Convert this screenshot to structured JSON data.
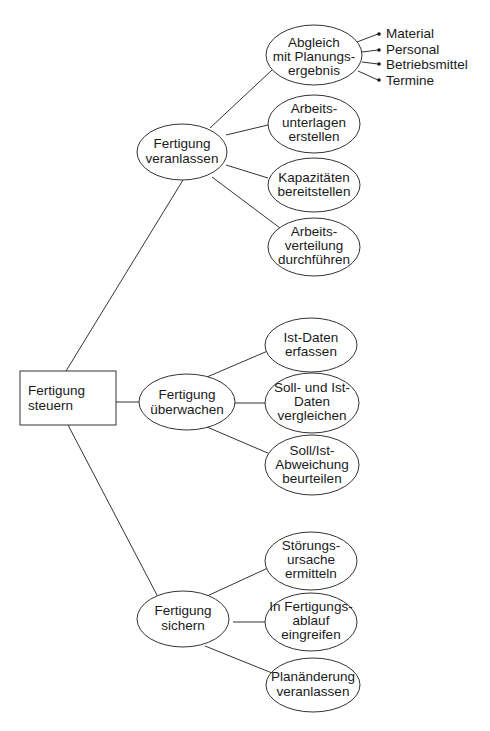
{
  "diagram": {
    "type": "tree",
    "root": {
      "id": "root",
      "lines": [
        "Fertigung",
        "steuern"
      ],
      "shape": "rect"
    },
    "branches": [
      {
        "id": "b1",
        "lines": [
          "Fertigung",
          "veranlassen"
        ],
        "children": [
          {
            "id": "b1c1",
            "lines": [
              "Abgleich",
              "mit Planungs-",
              "ergebnis"
            ],
            "leaves": [
              "Material",
              "Personal",
              "Betriebsmittel",
              "Termine"
            ]
          },
          {
            "id": "b1c2",
            "lines": [
              "Arbeits-",
              "unterlagen",
              "erstellen"
            ]
          },
          {
            "id": "b1c3",
            "lines": [
              "Kapazitäten",
              "bereitstellen"
            ]
          },
          {
            "id": "b1c4",
            "lines": [
              "Arbeits-",
              "verteilung",
              "durchführen"
            ]
          }
        ]
      },
      {
        "id": "b2",
        "lines": [
          "Fertigung",
          "überwachen"
        ],
        "children": [
          {
            "id": "b2c1",
            "lines": [
              "Ist-Daten",
              "erfassen"
            ]
          },
          {
            "id": "b2c2",
            "lines": [
              "Soll- und Ist-",
              "Daten",
              "vergleichen"
            ]
          },
          {
            "id": "b2c3",
            "lines": [
              "Soll/Ist-",
              "Abweichung",
              "beurteilen"
            ]
          }
        ]
      },
      {
        "id": "b3",
        "lines": [
          "Fertigung",
          "sichern"
        ],
        "children": [
          {
            "id": "b3c1",
            "lines": [
              "Störungs-",
              "ursache",
              "ermitteln"
            ]
          },
          {
            "id": "b3c2",
            "lines": [
              "In Fertigungs-",
              "ablauf",
              "eingreifen"
            ]
          },
          {
            "id": "b3c3",
            "lines": [
              "Planänderung",
              "veranlassen"
            ]
          }
        ]
      }
    ]
  },
  "colors": {
    "line": "#333333",
    "text": "#1a1a1a",
    "background": "#ffffff"
  }
}
